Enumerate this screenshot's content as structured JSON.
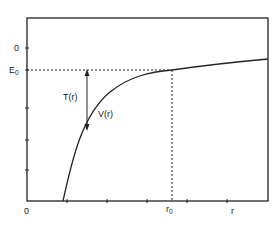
{
  "diagram": {
    "type": "potential-energy-curve",
    "y_axis": {
      "tick_labels": [
        "0",
        "E0"
      ],
      "zero_label": "0",
      "energy_label_main": "E",
      "energy_label_sub": "0"
    },
    "x_axis": {
      "origin_label": "0",
      "r0_label_main": "r",
      "r0_label_sub": "0",
      "r_label": "r"
    },
    "curve_label": "V(r)",
    "arrow_label": "T(r)",
    "colors": {
      "line": "#222222",
      "background": "#ffffff"
    }
  }
}
